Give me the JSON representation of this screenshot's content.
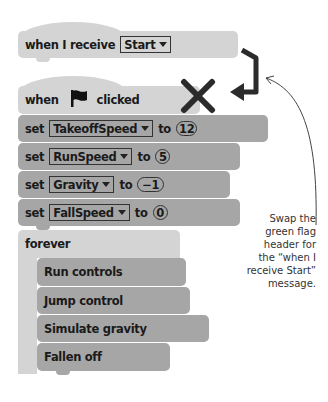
{
  "receive_block": {
    "label": "when I receive",
    "message": "Start"
  },
  "flag_block": {
    "prefix": "when",
    "icon": "green-flag-icon",
    "suffix": "clicked"
  },
  "set_blocks": [
    {
      "keyword": "set",
      "variable": "TakeoffSpeed",
      "to": "to",
      "value": "12"
    },
    {
      "keyword": "set",
      "variable": "RunSpeed",
      "to": "to",
      "value": "5"
    },
    {
      "keyword": "set",
      "variable": "Gravity",
      "to": "to",
      "value": "−1"
    },
    {
      "keyword": "set",
      "variable": "FallSpeed",
      "to": "to",
      "value": "0"
    }
  ],
  "forever_block": {
    "label": "forever",
    "children": [
      "Run controls",
      "Jump control",
      "Simulate gravity",
      "Fallen off"
    ]
  },
  "annotation": {
    "lines": [
      "Swap the",
      "green flag",
      "header for",
      "the “when I",
      "receive Start”",
      "message."
    ]
  },
  "colors": {
    "hat_block": "#d4d4d4",
    "stack_block": "#a6a6a6",
    "mark": "#2b2b2b"
  }
}
